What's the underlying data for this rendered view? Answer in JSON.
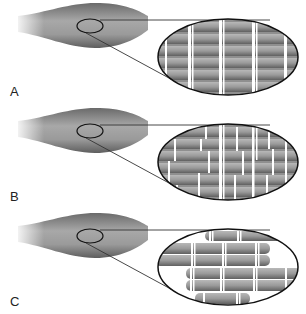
{
  "figure": {
    "panels": [
      {
        "label": "A",
        "pattern": "aligned-striated",
        "description": "Muscle with zoomed view of regularly aligned striated fibers"
      },
      {
        "label": "B",
        "pattern": "irregular-striated",
        "description": "Muscle with zoomed view of irregular, disrupted striations"
      },
      {
        "label": "C",
        "pattern": "separated-fibers",
        "description": "Muscle with zoomed view of fibers pulled apart / misaligned"
      }
    ],
    "colors": {
      "muscle": "#8a8a8a",
      "fiber": "#9a9a9a",
      "fiber_dark": "#6e6e6e",
      "band": "#ffffff",
      "outline": "#111111"
    }
  }
}
